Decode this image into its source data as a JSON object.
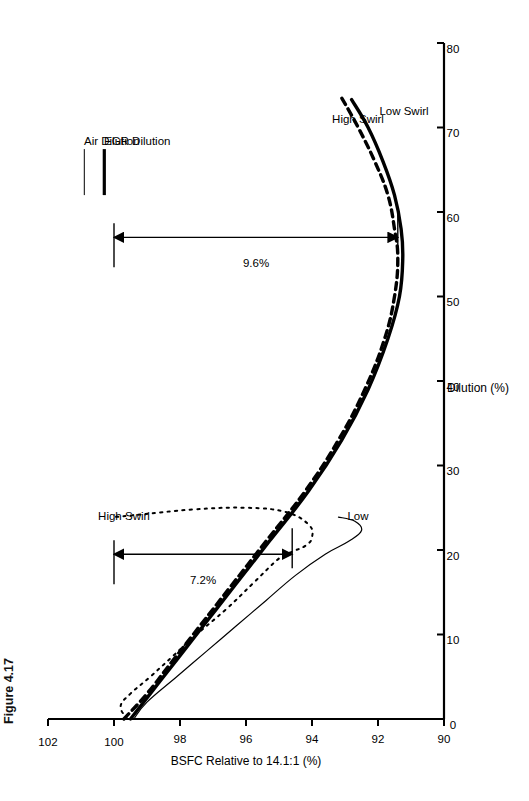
{
  "figure": {
    "caption": "Figure 4.17"
  },
  "legend": {
    "position": "top-left",
    "items": [
      {
        "label": "Air Dilution",
        "style": "thin-solid",
        "width": 1
      },
      {
        "label": "EGR Dilution",
        "style": "thick-solid",
        "width": 3.2
      }
    ]
  },
  "annotations": {
    "egr_span": {
      "label": "9.6%",
      "from": 100.0,
      "to": 91.4,
      "at_x": 57
    },
    "air_span": {
      "label": "7.2%",
      "from": 100.0,
      "to": 94.6,
      "at_x": 19.5
    },
    "curve_labels": [
      {
        "label": "High Swirl",
        "series": "air-high-swirl",
        "x": 24,
        "y": 99.7
      },
      {
        "label": "Low",
        "series": "air-low-swirl",
        "x": 24,
        "y": 92.6
      },
      {
        "label": "High Swirl",
        "series": "egr-high-swirl",
        "x": 71,
        "y": 92.6
      },
      {
        "label": "Low Swirl",
        "series": "egr-low-swirl",
        "x": 72,
        "y": 91.2
      }
    ]
  },
  "chart_data": {
    "type": "line",
    "title": "",
    "xlabel": "Dilution (%)",
    "ylabel": "BSFC Relative to 14.1:1 (%)",
    "xlim": [
      0,
      80
    ],
    "ylim": [
      90,
      102
    ],
    "xticks": [
      0,
      10,
      20,
      30,
      40,
      50,
      60,
      70,
      80
    ],
    "yticks": [
      90,
      92,
      94,
      96,
      98,
      100,
      102
    ],
    "grid": false,
    "legend_position": "top-left",
    "series": [
      {
        "name": "Air Dilution - High Swirl",
        "id": "air-high-swirl",
        "style": "dotted",
        "linewidth": 2.0,
        "points": [
          [
            0.0,
            99.6
          ],
          [
            1.5,
            99.8
          ],
          [
            3.0,
            99.5
          ],
          [
            5.0,
            98.9
          ],
          [
            7.5,
            98.2
          ],
          [
            10.0,
            97.5
          ],
          [
            13.0,
            96.6
          ],
          [
            16.0,
            95.8
          ],
          [
            19.0,
            95.0
          ],
          [
            19.8,
            94.6
          ],
          [
            20.5,
            94.2
          ],
          [
            21.5,
            94.0
          ],
          [
            23.0,
            94.1
          ],
          [
            24.5,
            94.8
          ],
          [
            25.0,
            96.0
          ],
          [
            24.8,
            97.6
          ],
          [
            24.2,
            99.2
          ],
          [
            23.9,
            100.0
          ]
        ]
      },
      {
        "name": "Air Dilution - Low Swirl",
        "id": "air-low-swirl",
        "style": "solid",
        "linewidth": 1.2,
        "points": [
          [
            0.0,
            99.4
          ],
          [
            2.0,
            99.0
          ],
          [
            5.0,
            98.1
          ],
          [
            8.0,
            97.2
          ],
          [
            11.0,
            96.3
          ],
          [
            14.0,
            95.4
          ],
          [
            17.0,
            94.5
          ],
          [
            19.5,
            93.6
          ],
          [
            21.0,
            92.9
          ],
          [
            22.3,
            92.5
          ],
          [
            23.4,
            92.7
          ],
          [
            23.9,
            93.2
          ]
        ]
      },
      {
        "name": "EGR Dilution - High Swirl",
        "id": "egr-high-swirl",
        "style": "dashed",
        "linewidth": 3.4,
        "points": [
          [
            0.0,
            99.7
          ],
          [
            3.0,
            99.0
          ],
          [
            7.0,
            98.2
          ],
          [
            11.0,
            97.4
          ],
          [
            16.0,
            96.4
          ],
          [
            21.0,
            95.4
          ],
          [
            27.0,
            94.2
          ],
          [
            33.0,
            93.2
          ],
          [
            39.0,
            92.4
          ],
          [
            45.0,
            91.8
          ],
          [
            50.0,
            91.5
          ],
          [
            54.5,
            91.4
          ],
          [
            58.0,
            91.5
          ],
          [
            62.0,
            91.7
          ],
          [
            66.0,
            92.1
          ],
          [
            70.0,
            92.6
          ],
          [
            73.5,
            93.1
          ]
        ]
      },
      {
        "name": "EGR Dilution - Low Swirl",
        "id": "egr-low-swirl",
        "style": "solid",
        "linewidth": 3.4,
        "points": [
          [
            0.0,
            99.5
          ],
          [
            3.0,
            98.9
          ],
          [
            7.0,
            98.1
          ],
          [
            11.0,
            97.3
          ],
          [
            16.0,
            96.3
          ],
          [
            21.0,
            95.3
          ],
          [
            27.0,
            94.1
          ],
          [
            33.0,
            93.1
          ],
          [
            39.0,
            92.3
          ],
          [
            45.0,
            91.7
          ],
          [
            50.0,
            91.35
          ],
          [
            54.5,
            91.25
          ],
          [
            58.0,
            91.3
          ],
          [
            62.0,
            91.5
          ],
          [
            66.0,
            91.85
          ],
          [
            70.0,
            92.3
          ],
          [
            73.3,
            92.8
          ]
        ]
      }
    ]
  }
}
